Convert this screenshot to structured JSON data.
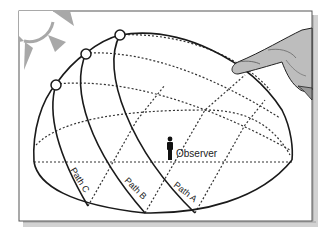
{
  "figure": {
    "observer_label": "Observer",
    "paths": [
      {
        "id": "C",
        "label": "Path C"
      },
      {
        "id": "B",
        "label": "Path B"
      },
      {
        "id": "A",
        "label": "Path A"
      }
    ],
    "icons": {
      "sun": "sun-icon",
      "hand": "pointing-hand-icon",
      "observer": "person-icon"
    },
    "colors": {
      "line": "#1a1a1a",
      "dashed": "#333333",
      "sun": "#a9a9a9",
      "hand": "#b5b5b5",
      "frame": "#444444",
      "shadow": "#c8c8c8"
    }
  }
}
